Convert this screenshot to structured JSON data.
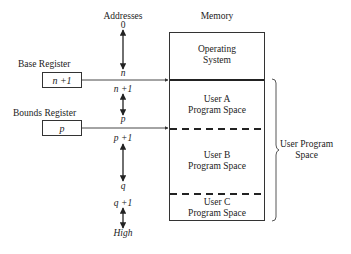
{
  "diagram": {
    "addresses_header": "Addresses",
    "memory_header": "Memory",
    "registers": [
      {
        "label": "Base Register",
        "value": "n +1"
      },
      {
        "label": "Bounds Register",
        "value": "p"
      }
    ],
    "address_labels": {
      "a0": "0",
      "n": "n",
      "n_plus_1": "n +1",
      "p": "p",
      "p_plus_1": "p +1",
      "q": "q",
      "q_plus_1": "q +1",
      "high": "High"
    },
    "memory_regions": [
      {
        "line1": "Operating",
        "line2": "System"
      },
      {
        "line1": "User A",
        "line2": "Program Space"
      },
      {
        "line1": "User B",
        "line2": "Program Space"
      },
      {
        "line1": "User C",
        "line2": "Program Space"
      }
    ],
    "brace_label": {
      "line1": "User Program",
      "line2": "Space"
    },
    "colors": {
      "line": "#333333",
      "text": "#222222",
      "background": "#ffffff"
    }
  }
}
